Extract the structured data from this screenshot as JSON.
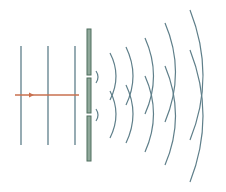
{
  "colors": {
    "wave": "#5f7f8a",
    "barrier_fill": "#8fa89a",
    "barrier_stroke": "#4f6f5f",
    "ray": "#c8704f"
  },
  "incident_wavefronts": [
    {
      "x": 21
    },
    {
      "x": 48
    },
    {
      "x": 75
    }
  ],
  "ray": {
    "y": 95,
    "x1": 15,
    "x2": 79,
    "arrow_x": 32
  },
  "barrier": {
    "x": 87,
    "width": 4,
    "segments": [
      {
        "y1": 29,
        "y2": 75
      },
      {
        "y1": 78,
        "y2": 113
      },
      {
        "y1": 116,
        "y2": 161
      }
    ]
  },
  "slits": [
    {
      "y": 76.5
    },
    {
      "y": 114.5
    }
  ]
}
